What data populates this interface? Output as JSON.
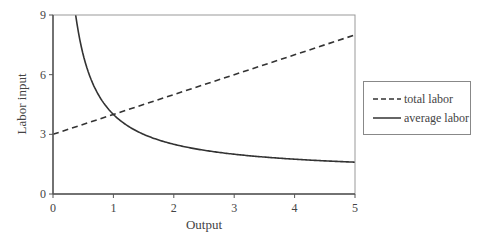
{
  "chart_data": {
    "type": "line",
    "title": "",
    "xlabel": "Output",
    "ylabel": "Labor input",
    "xlim": [
      0,
      5
    ],
    "ylim": [
      0,
      9
    ],
    "xticks": [
      0,
      1,
      2,
      3,
      4,
      5
    ],
    "yticks": [
      0,
      3,
      6,
      9
    ],
    "grid": false,
    "legend_position": "right-outside",
    "series": [
      {
        "name": "total labor",
        "style": "dashed",
        "x": [
          0,
          1,
          2,
          3,
          4,
          5
        ],
        "values": [
          3,
          4,
          5,
          6,
          7,
          8
        ]
      },
      {
        "name": "average labor",
        "style": "solid",
        "x": [
          0.375,
          0.5,
          0.75,
          1,
          1.5,
          2,
          2.5,
          3,
          3.5,
          4,
          4.5,
          5
        ],
        "values": [
          9,
          7,
          5,
          4,
          3,
          2.5,
          2.2,
          2,
          1.86,
          1.75,
          1.67,
          1.6
        ]
      }
    ]
  },
  "legend": {
    "items": [
      {
        "label": "total labor",
        "style": "dashed"
      },
      {
        "label": "average labor",
        "style": "solid"
      }
    ]
  },
  "colors": {
    "line": "#333333",
    "axis": "#555555",
    "text": "#444444"
  }
}
